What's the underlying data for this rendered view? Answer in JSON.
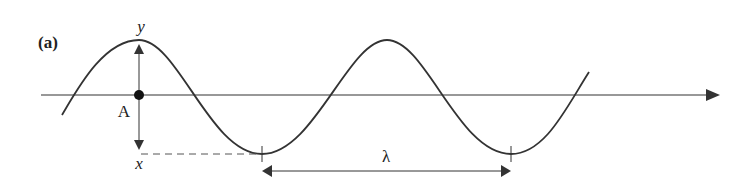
{
  "figure": {
    "panel_label": "(a)",
    "y_label": "y",
    "x_label": "x",
    "point_label": "A",
    "wavelength_label": "λ"
  },
  "colors": {
    "line": "#333333",
    "background": "#ffffff"
  }
}
